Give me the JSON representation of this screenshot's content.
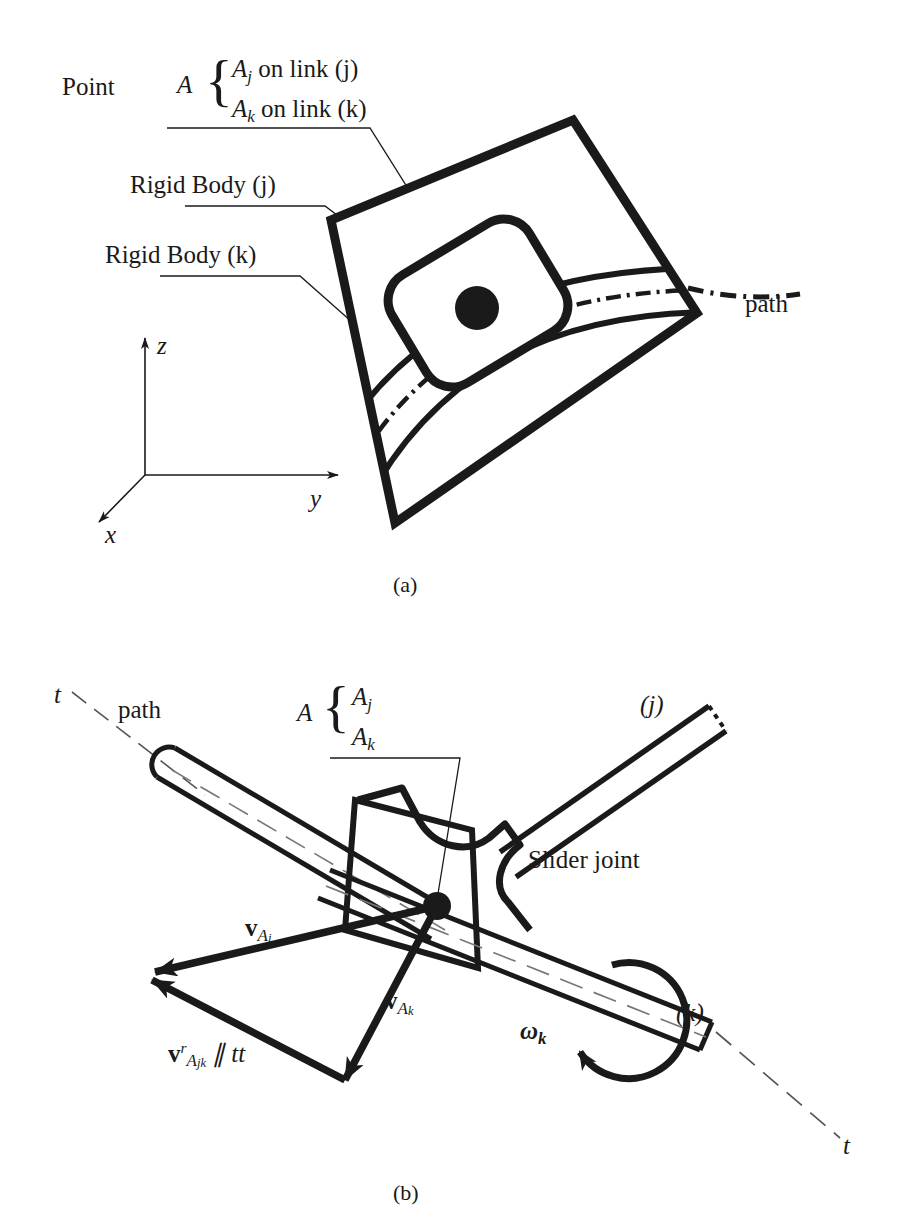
{
  "figure": {
    "title_domain": "kinematics-diagram",
    "captions": [
      {
        "id": "a",
        "text": "(a)"
      },
      {
        "id": "b",
        "text": "(b)"
      }
    ]
  },
  "panel_a": {
    "labels": {
      "point": "Point",
      "point_symbol": "A",
      "brace": "{",
      "point_line1_sym": "A",
      "point_line1_sub": "j",
      "point_line1_rest": " on link (j)",
      "point_line2_sym": "A",
      "point_line2_sub": "k",
      "point_line2_rest": " on link (k)",
      "rigid_body_j": "Rigid Body (j)",
      "rigid_body_k": "Rigid Body (k)",
      "path": "path"
    },
    "axes": {
      "z": "z",
      "y": "y",
      "x": "x"
    }
  },
  "panel_b": {
    "labels": {
      "t_left": "t",
      "t_right": "t",
      "path": "path",
      "point_symbol": "A",
      "brace": "{",
      "point_line1_sym": "A",
      "point_line1_sub": "j",
      "point_line2_sym": "A",
      "point_line2_sub": "k",
      "link_j": "(j)",
      "link_k": "(k)",
      "slider_joint": "Slider joint",
      "omega_sym": "ω",
      "omega_sub": "k",
      "v_aj_sym": "v",
      "v_aj_sub": "A",
      "v_aj_sub2": "j",
      "v_ak_sym": "v",
      "v_ak_sub": "A",
      "v_ak_sub2": "k",
      "v_rel_sym": "v",
      "v_rel_sup": "r",
      "v_rel_sub": "A",
      "v_rel_sub2": "jk",
      "v_rel_rest": "∥ tt"
    }
  },
  "style": {
    "ink": "#1a1a1a",
    "stroke_heavy": 9,
    "stroke_medium": 5,
    "stroke_thin": 1.2,
    "background": "#ffffff"
  }
}
